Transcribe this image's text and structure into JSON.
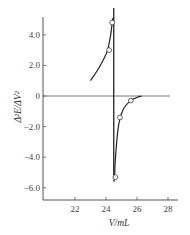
{
  "chart_data": {
    "type": "line",
    "title": "",
    "xlabel": "V/mL",
    "ylabel": "Δ²E/ΔV²",
    "xlim": [
      20.5,
      28.5
    ],
    "ylim": [
      -7.0,
      5.2
    ],
    "xticks": [
      22,
      24,
      26,
      28
    ],
    "xtick_labels": [
      "22",
      "24",
      "26",
      "28"
    ],
    "yticks": [
      4.0,
      2.0,
      0,
      -2.0,
      -4.0,
      -6.0
    ],
    "ytick_labels": [
      "4.0",
      "2.0",
      "0",
      "−2.0",
      "−4.0",
      "−6.0"
    ],
    "zero_line": true,
    "endpoint_line_x": 24.5,
    "grid": false,
    "legend": "none",
    "series": [
      {
        "name": "upper-branch-curve",
        "x": [
          23.0,
          23.4,
          23.8,
          24.1,
          24.3,
          24.4,
          24.45
        ],
        "y": [
          1.0,
          1.6,
          2.3,
          3.0,
          4.0,
          4.8,
          5.1
        ]
      },
      {
        "name": "lower-branch-curve",
        "x": [
          24.5,
          24.55,
          24.6,
          24.8,
          25.1,
          25.6,
          26.0,
          26.3
        ],
        "y": [
          -5.6,
          -5.3,
          -4.2,
          -2.0,
          -0.9,
          -0.3,
          -0.1,
          0.0
        ]
      },
      {
        "name": "data-points",
        "x": [
          24.2,
          24.4,
          24.6,
          24.9,
          25.6
        ],
        "y": [
          3.0,
          4.8,
          -5.3,
          -1.4,
          -0.3
        ]
      }
    ]
  }
}
